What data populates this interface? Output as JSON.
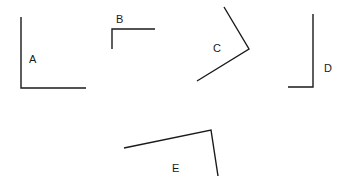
{
  "figure": {
    "width": 355,
    "height": 188,
    "background_color": "#ffffff",
    "stroke_color": "#1a1a1a",
    "stroke_width": 1.4,
    "label_color": "#1a1a1a",
    "label_font_size": 11
  },
  "chart_data": {
    "type": "diagram",
    "subtype": "angle-shapes",
    "title": "",
    "xlabel": "",
    "ylabel": "",
    "coordinate_space": {
      "x_range": [
        0,
        355
      ],
      "y_range": [
        0,
        188
      ],
      "origin": "top-left"
    },
    "shapes": [
      {
        "id": "A",
        "label": "A",
        "vertex": [
          21,
          88
        ],
        "endpoints": [
          [
            21,
            17
          ],
          [
            86,
            88
          ]
        ],
        "points": "21,17 21,88 86,88",
        "orientation": "opens up-right",
        "label_position": [
          29,
          54
        ]
      },
      {
        "id": "B",
        "label": "B",
        "vertex": [
          112,
          29
        ],
        "endpoints": [
          [
            112,
            49
          ],
          [
            155,
            29
          ]
        ],
        "points": "112,49 112,29 155,29",
        "orientation": "opens down-right",
        "label_position": [
          116,
          14
        ]
      },
      {
        "id": "C",
        "label": "C",
        "vertex": [
          249,
          49
        ],
        "endpoints": [
          [
            224,
            7
          ],
          [
            197,
            81
          ]
        ],
        "points": "224,7 249,49 197,81",
        "orientation": "opens left",
        "label_position": [
          213,
          43
        ]
      },
      {
        "id": "D",
        "label": "D",
        "vertex": [
          313,
          87
        ],
        "endpoints": [
          [
            313,
            14
          ],
          [
            288,
            87
          ]
        ],
        "points": "313,14 313,87 288,87",
        "orientation": "opens up-left",
        "label_position": [
          324,
          63
        ]
      },
      {
        "id": "E",
        "label": "E",
        "vertex": [
          211,
          130
        ],
        "endpoints": [
          [
            124,
            148
          ],
          [
            218,
            176
          ]
        ],
        "points": "124,148 211,130 218,176",
        "orientation": "opens down-left",
        "label_position": [
          172,
          163
        ]
      }
    ]
  }
}
